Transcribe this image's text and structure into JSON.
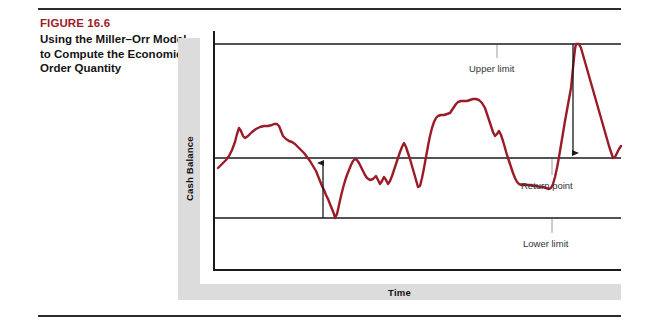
{
  "figure": {
    "number": "FIGURE 16.6",
    "title": "Using the Miller–Orr Model to Compute the Economic Order Quantity",
    "number_color": "#9e1b29"
  },
  "chart_data": {
    "type": "line",
    "title": "",
    "xlabel": "Time",
    "ylabel": "Cash Balance",
    "grid": false,
    "legend": null,
    "series_color": "#9b1b28",
    "annotations": [
      {
        "label": "Upper limit",
        "target": "upper-limit-line"
      },
      {
        "label": "Return point",
        "target": "return-point-line"
      },
      {
        "label": "Lower limit",
        "target": "lower-limit-line"
      }
    ],
    "reference_lines": [
      {
        "name": "Upper limit",
        "y": 44
      },
      {
        "name": "Return point",
        "y": 158
      },
      {
        "name": "Lower limit",
        "y": 218
      }
    ],
    "axis_ranges": {
      "x": [
        213,
        621
      ],
      "y": [
        31,
        270
      ]
    },
    "control_arrows": [
      {
        "name": "buy-securities-arrow",
        "x": 323,
        "from_y": 218,
        "to_y": 158,
        "direction": "up"
      },
      {
        "name": "sell-securities-arrow",
        "x": 573,
        "from_y": 44,
        "to_y": 158,
        "direction": "down"
      }
    ],
    "cash_balance_path": "M218,168 L222,164 L226,160 L229,156 L232,150 L235,142 L237,134 L239,128 L241,131 L243,136 L245,138 L248,136 L252,132 L256,129 L260,127 L264,126 L268,126 L272,125 L274,124 L277,124 L279,126 L281,131 L283,136 L286,139 L289,141 L292,142 L295,144 L298,147 L301,150 L304,153 L307,157 L310,161 L313,166 L316,171 L318,176 L320,181 L322,186 L324,190 L326,195 L328,199 L330,204 L332,209 L334,214 L335,218 L337,214 L339,205 L341,196 L343,188 L345,181 L347,175 L349,170 L351,165 L353,161 L355,159 L357,160 L359,163 L361,167 L363,171 L365,175 L367,178 L370,180 L373,179 L376,176 L378,180 L380,184 L382,181 L384,177 L386,180 L388,184 L390,181 L392,176 L394,170 L396,164 L398,158 L400,152 L402,147 L404,143 L406,147 L408,153 L410,159 L412,166 L414,173 L416,180 L418,187 L420,186 L422,178 L424,168 L426,157 L428,146 L430,136 L432,128 L434,122 L436,118 L438,116 L441,115 L444,115 L447,114 L450,113 L452,110 L454,107 L456,104 L458,102 L461,101 L464,101 L467,101 L470,100 L473,99 L476,99 L479,100 L482,103 L485,108 L487,114 L489,120 L491,126 L493,132 L495,136 L497,134 L499,131 L501,135 L503,141 L505,148 L507,155 L509,161 L511,167 L513,173 L515,178 L517,182 L519,184 L522,185 L525,185 L528,185 L531,185 L534,186 L537,186 L540,187 L543,187 L546,188 L549,189 L551,188 L553,184 L555,177 L557,168 L559,157 L561,145 L563,133 L565,121 L567,110 L569,99 L571,88 L572,78 L573,68 L574,58 L575,49 L576,44 L579,44 L581,48 L583,55 L585,62 L587,69 L589,76 L591,83 L593,90 L595,97 L597,104 L599,111 L601,118 L603,125 L605,132 L607,139 L609,146 L611,152 L613,158 L615,157 L617,153 L619,149 L621,146"
  }
}
